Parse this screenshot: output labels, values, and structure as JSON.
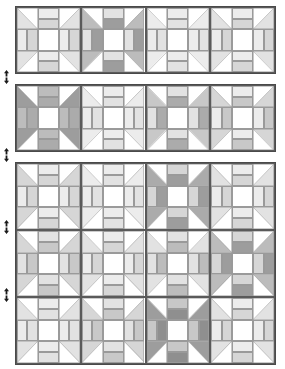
{
  "document": {
    "title": "Quilt Layout Diagram",
    "type": "quilt-block-layout",
    "canvas": {
      "width": 285,
      "height": 369,
      "background": "#ffffff"
    },
    "block_name": "churn-dash",
    "block_structure": {
      "grid": "3x3",
      "corners": "half-square-triangle",
      "sides": "two-bar-rectangle",
      "center": "plain-square"
    }
  },
  "palette": {
    "outline_dark": "#4a4a4a",
    "outline_block": "#5a5a5a",
    "hairline": "#9a9a9a",
    "background": "#ffffff",
    "shades": {
      "s0": "#ffffff",
      "s1": "#f4f4f4",
      "s2": "#ececec",
      "s3": "#e2e2e2",
      "s4": "#d6d6d6",
      "s5": "#c8c8c8",
      "s6": "#bcbcbc",
      "s7": "#ababab",
      "s8": "#9d9d9d",
      "s9": "#8f8f8f"
    }
  },
  "markers": {
    "name": "seam-arrow",
    "glyph": "up-down-arrow",
    "color": "#1a1a1a",
    "positions": [
      {
        "id": "seam-1",
        "x": 2,
        "y": 70
      },
      {
        "id": "seam-2",
        "x": 2,
        "y": 148
      },
      {
        "id": "seam-3",
        "x": 2,
        "y": 220
      },
      {
        "id": "seam-4",
        "x": 2,
        "y": 288
      }
    ]
  },
  "panels": [
    {
      "id": "panel-1",
      "label": "Row Section 1",
      "x": 15,
      "y": 6,
      "width": 261,
      "height": 68,
      "rows": 1,
      "cols": 4,
      "blocks": [
        {
          "id": "p1r1c1",
          "corner": "s3",
          "bar_a": "s2",
          "bar_b": "s4",
          "center": "s0"
        },
        {
          "id": "p1r1c2",
          "corner": "s6",
          "bar_a": "s3",
          "bar_b": "s8",
          "center": "s0"
        },
        {
          "id": "p1r1c3",
          "corner": "s2",
          "bar_a": "s2",
          "bar_b": "s3",
          "center": "s0"
        },
        {
          "id": "p1r1c4",
          "corner": "s3",
          "bar_a": "s2",
          "bar_b": "s4",
          "center": "s0"
        }
      ]
    },
    {
      "id": "panel-2",
      "label": "Row Section 2",
      "x": 15,
      "y": 84,
      "width": 261,
      "height": 68,
      "rows": 1,
      "cols": 4,
      "blocks": [
        {
          "id": "p2r1c1",
          "corner": "s8",
          "bar_a": "s6",
          "bar_b": "s7",
          "center": "s0"
        },
        {
          "id": "p2r1c2",
          "corner": "s2",
          "bar_a": "s2",
          "bar_b": "s3",
          "center": "s0"
        },
        {
          "id": "p2r1c3",
          "corner": "s5",
          "bar_a": "s3",
          "bar_b": "s7",
          "center": "s0"
        },
        {
          "id": "p2r1c4",
          "corner": "s4",
          "bar_a": "s2",
          "bar_b": "s5",
          "center": "s0"
        }
      ]
    },
    {
      "id": "panel-3",
      "label": "Row Section 3",
      "x": 15,
      "y": 162,
      "width": 261,
      "height": 203,
      "rows": 3,
      "cols": 4,
      "blocks": [
        {
          "id": "p3r1c1",
          "corner": "s4",
          "bar_a": "s2",
          "bar_b": "s4",
          "center": "s0"
        },
        {
          "id": "p3r1c2",
          "corner": "s2",
          "bar_a": "s2",
          "bar_b": "s3",
          "center": "s0"
        },
        {
          "id": "p3r1c3",
          "corner": "s7",
          "bar_a": "s4",
          "bar_b": "s8",
          "center": "s0"
        },
        {
          "id": "p3r1c4",
          "corner": "s3",
          "bar_a": "s2",
          "bar_b": "s4",
          "center": "s0"
        },
        {
          "id": "p3r2c1",
          "corner": "s4",
          "bar_a": "s3",
          "bar_b": "s5",
          "center": "s0"
        },
        {
          "id": "p3r2c2",
          "corner": "s3",
          "bar_a": "s2",
          "bar_b": "s4",
          "center": "s0"
        },
        {
          "id": "p3r2c3",
          "corner": "s3",
          "bar_a": "s3",
          "bar_b": "s6",
          "center": "s0"
        },
        {
          "id": "p3r2c4",
          "corner": "s6",
          "bar_a": "s4",
          "bar_b": "s8",
          "center": "s0"
        },
        {
          "id": "p3r3c1",
          "corner": "s3",
          "bar_a": "s2",
          "bar_b": "s3",
          "center": "s0"
        },
        {
          "id": "p3r3c2",
          "corner": "s4",
          "bar_a": "s3",
          "bar_b": "s5",
          "center": "s0"
        },
        {
          "id": "p3r3c3",
          "corner": "s8",
          "bar_a": "s5",
          "bar_b": "s9",
          "center": "s0"
        },
        {
          "id": "p3r3c4",
          "corner": "s3",
          "bar_a": "s2",
          "bar_b": "s4",
          "center": "s0"
        }
      ]
    }
  ]
}
